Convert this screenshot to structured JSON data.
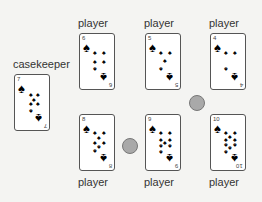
{
  "table": {
    "casekeeper": {
      "label": "casekeeper",
      "card": {
        "rank": "7",
        "suit": "spade"
      }
    },
    "players": [
      {
        "label": "player",
        "card": {
          "rank": "6",
          "suit": "spade"
        }
      },
      {
        "label": "player",
        "card": {
          "rank": "5",
          "suit": "spade"
        }
      },
      {
        "label": "player",
        "card": {
          "rank": "4",
          "suit": "spade"
        }
      },
      {
        "label": "player",
        "card": {
          "rank": "8",
          "suit": "spade"
        }
      },
      {
        "label": "player",
        "card": {
          "rank": "9",
          "suit": "spade"
        }
      },
      {
        "label": "player",
        "card": {
          "rank": "10",
          "suit": "spade"
        }
      }
    ],
    "chips": [
      {
        "color": "#a9a9a9"
      },
      {
        "color": "#a9a9a9"
      }
    ]
  }
}
